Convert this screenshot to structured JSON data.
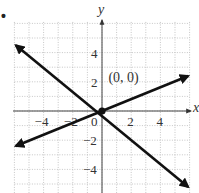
{
  "marker": "•",
  "chart_data": {
    "type": "line",
    "title": "",
    "xlabel": "x",
    "ylabel": "y",
    "xlim": [
      -6,
      6
    ],
    "ylim": [
      -6,
      6
    ],
    "grid": true,
    "grid_style": "dotted",
    "x_ticks": [
      -4,
      -2,
      0,
      2,
      4
    ],
    "y_ticks": [
      4,
      2,
      -2,
      -4
    ],
    "x_tick_labels": [
      "−4",
      "−2",
      "0",
      "2",
      "4"
    ],
    "y_tick_labels": [
      "4",
      "2",
      "−2",
      "−4"
    ],
    "series": [
      {
        "name": "line-negative-slope",
        "x": [
          -5.9,
          5.9
        ],
        "y": [
          4.5,
          -5.2
        ],
        "arrows": "both",
        "color": "#111111"
      },
      {
        "name": "line-positive-slope",
        "x": [
          -5.9,
          5.9
        ],
        "y": [
          -2.4,
          2.4
        ],
        "arrows": "both",
        "color": "#111111"
      }
    ],
    "points": [
      {
        "x": 0,
        "y": 0,
        "label": "(0, 0)"
      }
    ],
    "annotations": [
      {
        "text": "(0, 0)",
        "x": 0.3,
        "y": 2.3
      }
    ]
  }
}
